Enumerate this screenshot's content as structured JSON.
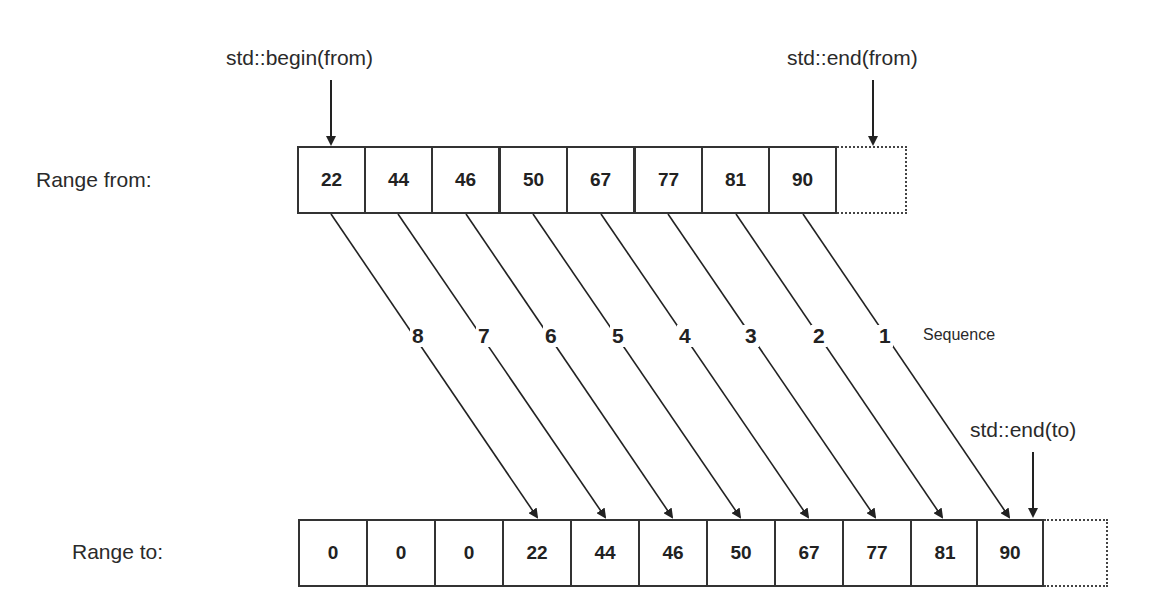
{
  "diagram": {
    "from_range": {
      "label": "Range from:",
      "values": [
        "22",
        "44",
        "46",
        "50",
        "67",
        "77",
        "81",
        "90"
      ],
      "begin_pointer": "std::begin(from)",
      "end_pointer": "std::end(from)"
    },
    "to_range": {
      "label": "Range to:",
      "values": [
        "0",
        "0",
        "0",
        "22",
        "44",
        "46",
        "50",
        "67",
        "77",
        "81",
        "90"
      ],
      "end_pointer": "std::end(to)"
    },
    "sequence": {
      "label": "Sequence",
      "steps": [
        "8",
        "7",
        "6",
        "5",
        "4",
        "3",
        "2",
        "1"
      ]
    },
    "colors": {
      "stroke": "#333333",
      "text": "#222222",
      "background": "#ffffff"
    }
  }
}
